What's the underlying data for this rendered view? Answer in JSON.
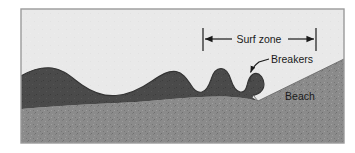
{
  "figure": {
    "type": "cross-section-illustration",
    "frame": {
      "x": 21,
      "y": 9,
      "width": 323,
      "height": 134,
      "border_color": "#9a9a9a"
    },
    "colors": {
      "sky": "#e9e9e9",
      "water": "#4a4a4a",
      "sand": "#8b8b8b",
      "line": "#1a1a1a",
      "frame": "#9a9a9a",
      "text": "#1a1a1a"
    },
    "labels": {
      "surf_zone": "Surf zone",
      "breakers": "Breakers",
      "beach": "Beach"
    },
    "annotations": {
      "surf_zone_dimension": {
        "label": "Surf zone",
        "left_tick_x": 203,
        "right_tick_x": 316,
        "tick_top_y": 28,
        "tick_bottom_y": 51,
        "arrow_y": 39,
        "text_x": 259,
        "text_y": 43
      },
      "breakers_leader": {
        "label": "Breakers",
        "text_x": 271,
        "text_y": 64,
        "arrow_tip_x": 249,
        "arrow_tip_y": 74
      },
      "beach_label": {
        "label": "Beach",
        "text_x": 300,
        "text_y": 99
      }
    },
    "geometry": {
      "sea_surface_path": "M21,76 C33,69 42,67 52,68 C64,69 72,78 82,85 C92,92 104,96 116,95 C130,94 142,88 152,81 C161,75 168,71 176,72 C183,73 187,79 191,85 C194,90 198,93 202,92 C206,91 209,86 211,80 C213,73 216,69 221,69 C226,69 229,74 231,80 C233,86 236,91 240,92 C244,93 246,90 247,86 C248,81 249,77 252,75 C255,73 259,74 262,77 C264,80 265,84 264,87 C263,91 259,94 254,95 L253,97 L344,97",
      "sea_bed_path": "M21,109 C45,107 70,105 95,104 C125,103 150,101 172,99 C195,97 215,96 232,97 C245,98 252,99 258,101 L344,60",
      "beach_slope_path": "M258,101 L344,60",
      "sky_region": "above sea surface",
      "water_region": "between sea surface and sea bed",
      "sand_region": "below sea bed"
    }
  }
}
